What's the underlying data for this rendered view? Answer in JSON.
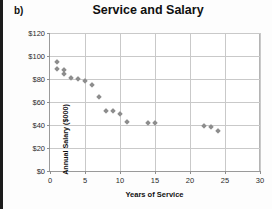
{
  "panel": {
    "label": "b)"
  },
  "chart_data": {
    "type": "scatter",
    "title": "Service and Salary",
    "xlabel": "Years of Service",
    "ylabel": "Annual Salary ($000)",
    "xlim": [
      0,
      30
    ],
    "ylim": [
      0,
      120
    ],
    "xticks": [
      0,
      5,
      10,
      15,
      20,
      25,
      30
    ],
    "xtick_labels": [
      "0",
      "5",
      "10",
      "15",
      "20",
      "25",
      "30"
    ],
    "yticks": [
      0,
      20,
      40,
      60,
      80,
      100,
      120
    ],
    "ytick_labels": [
      "$0",
      "$20",
      "$40",
      "$60",
      "$80",
      "$100",
      "$120"
    ],
    "grid": true,
    "legend": false,
    "marker": "diamond",
    "marker_color": "#8d8d8d",
    "series": [
      {
        "name": "Employees",
        "points": [
          {
            "x": 1,
            "y": 95
          },
          {
            "x": 1,
            "y": 89
          },
          {
            "x": 2,
            "y": 88
          },
          {
            "x": 2,
            "y": 84
          },
          {
            "x": 3,
            "y": 81
          },
          {
            "x": 4,
            "y": 80
          },
          {
            "x": 5,
            "y": 78
          },
          {
            "x": 6,
            "y": 75
          },
          {
            "x": 7,
            "y": 64
          },
          {
            "x": 8,
            "y": 52
          },
          {
            "x": 9,
            "y": 52
          },
          {
            "x": 10,
            "y": 50
          },
          {
            "x": 11,
            "y": 43
          },
          {
            "x": 14,
            "y": 42
          },
          {
            "x": 15,
            "y": 42
          },
          {
            "x": 22,
            "y": 39
          },
          {
            "x": 23,
            "y": 38.5
          },
          {
            "x": 24,
            "y": 35
          }
        ]
      }
    ]
  }
}
